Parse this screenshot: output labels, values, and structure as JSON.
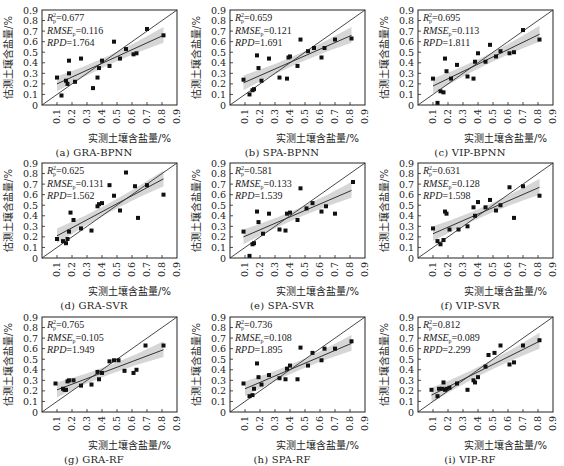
{
  "figure": {
    "xlabel": "实测土壤含盐量/%",
    "ylabel": "估测土壤含盐量/%",
    "x_ticks": [
      "0.1",
      "0.2",
      "0.3",
      "0.4",
      "0.5",
      "0.6",
      "0.7",
      "0.8",
      "0.9"
    ],
    "y_ticks": [
      "0",
      "0.1",
      "0.2",
      "0.3",
      "0.4",
      "0.5",
      "0.6",
      "0.7",
      "0.8",
      "0.9"
    ]
  },
  "chart_data": [
    {
      "type": "scatter",
      "id": "a",
      "caption": "(a) GRA-BPNN",
      "title": "GRA-BPNN",
      "xlabel": "实测土壤含盐量/%",
      "ylabel": "估测土壤含盐量/%",
      "xlim": [
        0,
        0.9
      ],
      "ylim": [
        0,
        0.9
      ],
      "stats": {
        "R2p": "0.677",
        "RMSEp": "0.116",
        "RPD": "1.764"
      },
      "fit": [
        [
          0.1,
          0.2
        ],
        [
          0.81,
          0.66
        ]
      ],
      "points": [
        [
          0.1,
          0.26
        ],
        [
          0.13,
          0.09
        ],
        [
          0.16,
          0.23
        ],
        [
          0.17,
          0.2
        ],
        [
          0.18,
          0.42
        ],
        [
          0.18,
          0.3
        ],
        [
          0.22,
          0.22
        ],
        [
          0.26,
          0.44
        ],
        [
          0.34,
          0.16
        ],
        [
          0.37,
          0.26
        ],
        [
          0.38,
          0.35
        ],
        [
          0.4,
          0.42
        ],
        [
          0.45,
          0.37
        ],
        [
          0.48,
          0.6
        ],
        [
          0.52,
          0.44
        ],
        [
          0.56,
          0.53
        ],
        [
          0.61,
          0.48
        ],
        [
          0.63,
          0.49
        ],
        [
          0.7,
          0.72
        ],
        [
          0.81,
          0.66
        ]
      ]
    },
    {
      "type": "scatter",
      "id": "b",
      "caption": "(b) SPA-BPNN",
      "title": "SPA-BPNN",
      "xlabel": "实测土壤含盐量/%",
      "ylabel": "估测土壤含盐量/%",
      "xlim": [
        0,
        0.9
      ],
      "ylim": [
        0,
        0.9
      ],
      "stats": {
        "R2p": "0.659",
        "RMSEp": "0.121",
        "RPD": "1.691"
      },
      "fit": [
        [
          0.09,
          0.21
        ],
        [
          0.81,
          0.66
        ]
      ],
      "points": [
        [
          0.09,
          0.24
        ],
        [
          0.13,
          0.1
        ],
        [
          0.15,
          0.14
        ],
        [
          0.16,
          0.15
        ],
        [
          0.18,
          0.47
        ],
        [
          0.19,
          0.35
        ],
        [
          0.21,
          0.23
        ],
        [
          0.26,
          0.44
        ],
        [
          0.33,
          0.26
        ],
        [
          0.38,
          0.25
        ],
        [
          0.39,
          0.45
        ],
        [
          0.4,
          0.46
        ],
        [
          0.45,
          0.37
        ],
        [
          0.47,
          0.62
        ],
        [
          0.52,
          0.51
        ],
        [
          0.56,
          0.54
        ],
        [
          0.61,
          0.45
        ],
        [
          0.63,
          0.54
        ],
        [
          0.7,
          0.62
        ],
        [
          0.81,
          0.63
        ]
      ]
    },
    {
      "type": "scatter",
      "id": "c",
      "caption": "(c) VIP-BPNN",
      "title": "VIP-BPNN",
      "xlabel": "实测土壤含盐量/%",
      "ylabel": "估测土壤含盐量/%",
      "xlim": [
        0,
        0.9
      ],
      "ylim": [
        0,
        0.9
      ],
      "stats": {
        "R2p": "0.695",
        "RMSEp": "0.113",
        "RPD": "1.811"
      },
      "fit": [
        [
          0.1,
          0.18
        ],
        [
          0.81,
          0.67
        ]
      ],
      "points": [
        [
          0.1,
          0.25
        ],
        [
          0.13,
          0.02
        ],
        [
          0.15,
          0.13
        ],
        [
          0.17,
          0.12
        ],
        [
          0.18,
          0.44
        ],
        [
          0.19,
          0.32
        ],
        [
          0.22,
          0.25
        ],
        [
          0.26,
          0.38
        ],
        [
          0.33,
          0.27
        ],
        [
          0.37,
          0.25
        ],
        [
          0.38,
          0.41
        ],
        [
          0.4,
          0.49
        ],
        [
          0.45,
          0.41
        ],
        [
          0.48,
          0.57
        ],
        [
          0.52,
          0.46
        ],
        [
          0.55,
          0.51
        ],
        [
          0.61,
          0.49
        ],
        [
          0.64,
          0.5
        ],
        [
          0.7,
          0.71
        ],
        [
          0.81,
          0.62
        ]
      ]
    },
    {
      "type": "scatter",
      "id": "d",
      "caption": "(d) GRA-SVR",
      "title": "GRA-SVR",
      "xlabel": "实测土壤含盐量/%",
      "ylabel": "估测土壤含盐量/%",
      "xlim": [
        0,
        0.9
      ],
      "ylim": [
        0,
        0.9
      ],
      "stats": {
        "R2p": "0.625",
        "RMSEp": "0.131",
        "RPD": "1.562"
      },
      "fit": [
        [
          0.1,
          0.21
        ],
        [
          0.81,
          0.75
        ]
      ],
      "points": [
        [
          0.1,
          0.18
        ],
        [
          0.14,
          0.16
        ],
        [
          0.16,
          0.14
        ],
        [
          0.17,
          0.18
        ],
        [
          0.18,
          0.25
        ],
        [
          0.19,
          0.43
        ],
        [
          0.21,
          0.36
        ],
        [
          0.26,
          0.28
        ],
        [
          0.33,
          0.26
        ],
        [
          0.37,
          0.49
        ],
        [
          0.38,
          0.51
        ],
        [
          0.4,
          0.52
        ],
        [
          0.45,
          0.69
        ],
        [
          0.48,
          0.59
        ],
        [
          0.52,
          0.45
        ],
        [
          0.56,
          0.81
        ],
        [
          0.62,
          0.68
        ],
        [
          0.64,
          0.38
        ],
        [
          0.7,
          0.69
        ],
        [
          0.81,
          0.6
        ]
      ]
    },
    {
      "type": "scatter",
      "id": "e",
      "caption": "(e) SPA-SVR",
      "title": "SPA-SVR",
      "xlabel": "实测土壤含盐量/%",
      "ylabel": "估测土壤含盐量/%",
      "xlim": [
        0,
        0.9
      ],
      "ylim": [
        0,
        0.9
      ],
      "stats": {
        "R2p": "0.581",
        "RMSEp": "0.133",
        "RPD": "1.539"
      },
      "fit": [
        [
          0.09,
          0.2
        ],
        [
          0.81,
          0.64
        ]
      ],
      "points": [
        [
          0.09,
          0.25
        ],
        [
          0.13,
          0.02
        ],
        [
          0.15,
          0.13
        ],
        [
          0.16,
          0.14
        ],
        [
          0.18,
          0.44
        ],
        [
          0.19,
          0.34
        ],
        [
          0.22,
          0.23
        ],
        [
          0.26,
          0.42
        ],
        [
          0.33,
          0.27
        ],
        [
          0.37,
          0.26
        ],
        [
          0.38,
          0.42
        ],
        [
          0.4,
          0.43
        ],
        [
          0.45,
          0.36
        ],
        [
          0.47,
          0.66
        ],
        [
          0.51,
          0.47
        ],
        [
          0.55,
          0.52
        ],
        [
          0.61,
          0.44
        ],
        [
          0.64,
          0.49
        ],
        [
          0.7,
          0.42
        ],
        [
          0.82,
          0.72
        ]
      ]
    },
    {
      "type": "scatter",
      "id": "f",
      "caption": "(f) VIP-SVR",
      "title": "VIP-SVR",
      "xlabel": "实测土壤含盐量/%",
      "ylabel": "估测土壤含盐量/%",
      "xlim": [
        0,
        0.9
      ],
      "ylim": [
        0,
        0.9
      ],
      "stats": {
        "R2p": "0.631",
        "RMSEp": "0.128",
        "RPD": "1.598"
      },
      "fit": [
        [
          0.1,
          0.23
        ],
        [
          0.81,
          0.67
        ]
      ],
      "points": [
        [
          0.1,
          0.28
        ],
        [
          0.13,
          0.16
        ],
        [
          0.15,
          0.13
        ],
        [
          0.17,
          0.17
        ],
        [
          0.18,
          0.44
        ],
        [
          0.19,
          0.42
        ],
        [
          0.21,
          0.27
        ],
        [
          0.27,
          0.27
        ],
        [
          0.33,
          0.3
        ],
        [
          0.37,
          0.48
        ],
        [
          0.38,
          0.4
        ],
        [
          0.4,
          0.53
        ],
        [
          0.45,
          0.48
        ],
        [
          0.48,
          0.55
        ],
        [
          0.52,
          0.45
        ],
        [
          0.55,
          0.5
        ],
        [
          0.61,
          0.67
        ],
        [
          0.64,
          0.38
        ],
        [
          0.7,
          0.68
        ],
        [
          0.81,
          0.59
        ]
      ]
    },
    {
      "type": "scatter",
      "id": "g",
      "caption": "(g) GRA-RF",
      "title": "GRA-RF",
      "xlabel": "实测土壤含盐量/%",
      "ylabel": "估测土壤含盐量/%",
      "xlim": [
        0,
        0.9
      ],
      "ylim": [
        0,
        0.9
      ],
      "stats": {
        "R2p": "0.765",
        "RMSEp": "0.105",
        "RPD": "1.949"
      },
      "fit": [
        [
          0.1,
          0.21
        ],
        [
          0.81,
          0.59
        ]
      ],
      "points": [
        [
          0.09,
          0.27
        ],
        [
          0.14,
          0.22
        ],
        [
          0.15,
          0.21
        ],
        [
          0.16,
          0.21
        ],
        [
          0.17,
          0.29
        ],
        [
          0.18,
          0.3
        ],
        [
          0.21,
          0.3
        ],
        [
          0.26,
          0.25
        ],
        [
          0.33,
          0.26
        ],
        [
          0.37,
          0.38
        ],
        [
          0.38,
          0.31
        ],
        [
          0.4,
          0.37
        ],
        [
          0.45,
          0.48
        ],
        [
          0.48,
          0.49
        ],
        [
          0.51,
          0.49
        ],
        [
          0.55,
          0.39
        ],
        [
          0.61,
          0.37
        ],
        [
          0.63,
          0.4
        ],
        [
          0.69,
          0.63
        ],
        [
          0.81,
          0.63
        ]
      ]
    },
    {
      "type": "scatter",
      "id": "h",
      "caption": "(h) SPA-RF",
      "title": "SPA-RF",
      "xlabel": "实测土壤含盐量/%",
      "ylabel": "估测土壤含盐量/%",
      "xlim": [
        0,
        0.9
      ],
      "ylim": [
        0,
        0.9
      ],
      "stats": {
        "R2p": "0.736",
        "RMSEp": "0.108",
        "RPD": "1.895"
      },
      "fit": [
        [
          0.1,
          0.22
        ],
        [
          0.81,
          0.65
        ]
      ],
      "points": [
        [
          0.09,
          0.27
        ],
        [
          0.13,
          0.15
        ],
        [
          0.15,
          0.16
        ],
        [
          0.16,
          0.22
        ],
        [
          0.18,
          0.46
        ],
        [
          0.19,
          0.33
        ],
        [
          0.21,
          0.26
        ],
        [
          0.26,
          0.35
        ],
        [
          0.33,
          0.32
        ],
        [
          0.37,
          0.31
        ],
        [
          0.38,
          0.41
        ],
        [
          0.4,
          0.44
        ],
        [
          0.45,
          0.31
        ],
        [
          0.47,
          0.61
        ],
        [
          0.52,
          0.44
        ],
        [
          0.55,
          0.56
        ],
        [
          0.61,
          0.49
        ],
        [
          0.63,
          0.6
        ],
        [
          0.7,
          0.6
        ],
        [
          0.81,
          0.67
        ]
      ]
    },
    {
      "type": "scatter",
      "id": "i",
      "caption": "(i) VIP-RF",
      "title": "VIP-RF",
      "xlabel": "实测土壤含盐量/%",
      "ylabel": "估测土壤含盐量/%",
      "xlim": [
        0,
        0.9
      ],
      "ylim": [
        0,
        0.9
      ],
      "stats": {
        "R2p": "0.812",
        "RMSEp": "0.089",
        "RPD": "2.299"
      },
      "fit": [
        [
          0.09,
          0.16
        ],
        [
          0.81,
          0.67
        ]
      ],
      "points": [
        [
          0.09,
          0.21
        ],
        [
          0.13,
          0.15
        ],
        [
          0.14,
          0.22
        ],
        [
          0.16,
          0.22
        ],
        [
          0.17,
          0.28
        ],
        [
          0.18,
          0.21
        ],
        [
          0.19,
          0.22
        ],
        [
          0.21,
          0.23
        ],
        [
          0.26,
          0.27
        ],
        [
          0.33,
          0.21
        ],
        [
          0.37,
          0.3
        ],
        [
          0.38,
          0.28
        ],
        [
          0.4,
          0.33
        ],
        [
          0.45,
          0.43
        ],
        [
          0.47,
          0.54
        ],
        [
          0.51,
          0.56
        ],
        [
          0.55,
          0.63
        ],
        [
          0.61,
          0.45
        ],
        [
          0.64,
          0.47
        ],
        [
          0.7,
          0.63
        ],
        [
          0.81,
          0.68
        ]
      ]
    }
  ],
  "colors": {
    "axis": "#222222",
    "point": "#111111",
    "band": "#d6d6d6",
    "line": "#333333"
  }
}
